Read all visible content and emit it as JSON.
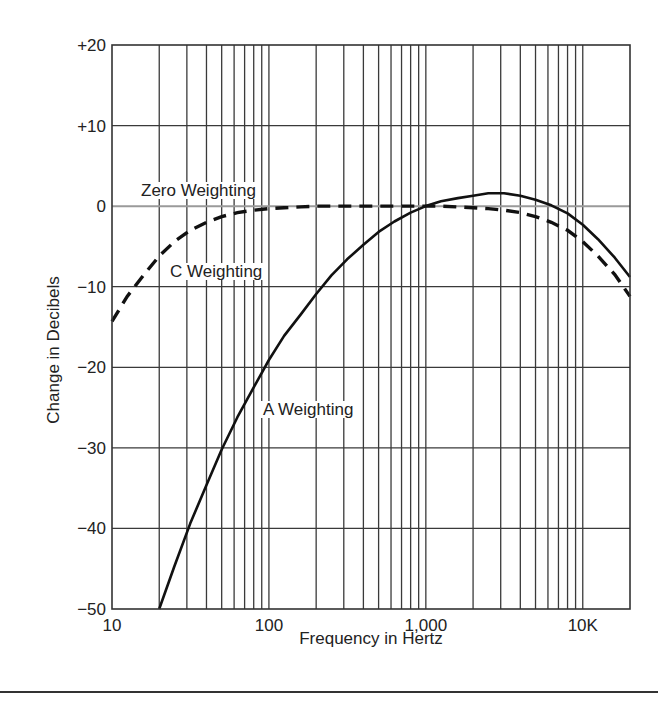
{
  "chart_data": {
    "type": "line",
    "title": "",
    "xlabel": "Frequency in Hertz",
    "ylabel": "Change in Decibels",
    "xscale": "log",
    "xlim": [
      10,
      20000
    ],
    "ylim": [
      -50,
      20
    ],
    "grid": true,
    "x_tick_labels": [
      {
        "value": 10,
        "label": "10"
      },
      {
        "value": 100,
        "label": "100"
      },
      {
        "value": 1000,
        "label": "1,000"
      },
      {
        "value": 10000,
        "label": "10K"
      }
    ],
    "y_tick_labels": [
      {
        "value": 20,
        "label": "+20"
      },
      {
        "value": 10,
        "label": "+10"
      },
      {
        "value": 0,
        "label": "0"
      },
      {
        "value": -10,
        "label": "−10"
      },
      {
        "value": -20,
        "label": "−20"
      },
      {
        "value": -30,
        "label": "−30"
      },
      {
        "value": -40,
        "label": "−40"
      },
      {
        "value": -50,
        "label": "−50"
      }
    ],
    "legend": "none (inline labels)",
    "series": [
      {
        "name": "Zero Weighting",
        "style": "solid-gray",
        "color": "#9a9a9a",
        "label_pos": {
          "x": 141,
          "y": 196
        },
        "x": [
          10,
          20000
        ],
        "values": [
          0,
          0
        ]
      },
      {
        "name": "C Weighting",
        "style": "dashed",
        "color": "#111111",
        "label_pos": {
          "x": 170,
          "y": 277
        },
        "x": [
          10,
          12.5,
          16,
          20,
          25,
          31.5,
          40,
          50,
          63,
          80,
          100,
          125,
          160,
          200,
          250,
          315,
          400,
          500,
          630,
          800,
          1000,
          1250,
          1600,
          2000,
          2500,
          3150,
          4000,
          5000,
          6300,
          8000,
          10000,
          12500,
          16000,
          20000
        ],
        "values": [
          -14.3,
          -11.2,
          -8.5,
          -6.2,
          -4.4,
          -3.0,
          -2.0,
          -1.3,
          -0.8,
          -0.5,
          -0.3,
          -0.2,
          -0.1,
          0,
          0,
          0,
          0,
          0,
          0,
          0,
          0,
          0,
          -0.1,
          -0.2,
          -0.3,
          -0.5,
          -0.8,
          -1.3,
          -2.0,
          -3.0,
          -4.4,
          -6.2,
          -8.5,
          -11.2
        ]
      },
      {
        "name": "A Weighting",
        "style": "solid",
        "color": "#111111",
        "label_pos": {
          "x": 263,
          "y": 415
        },
        "x": [
          20,
          25,
          31.5,
          40,
          50,
          63,
          80,
          100,
          125,
          160,
          200,
          250,
          315,
          400,
          500,
          630,
          800,
          1000,
          1250,
          1600,
          2000,
          2500,
          3150,
          4000,
          5000,
          6300,
          8000,
          10000,
          12500,
          16000,
          20000
        ],
        "values": [
          -50.5,
          -44.7,
          -39.4,
          -34.6,
          -30.2,
          -26.2,
          -22.5,
          -19.1,
          -16.1,
          -13.4,
          -10.9,
          -8.6,
          -6.6,
          -4.8,
          -3.2,
          -1.9,
          -0.8,
          0,
          0.6,
          1.0,
          1.3,
          1.6,
          1.6,
          1.3,
          0.8,
          0.1,
          -0.9,
          -2.3,
          -4.1,
          -6.4,
          -8.8
        ]
      }
    ],
    "annotations": [
      "Zero Weighting",
      "C Weighting",
      "A Weighting"
    ]
  },
  "layout": {
    "plot": {
      "left": 112,
      "top": 45,
      "right": 630,
      "bottom": 609
    },
    "colors": {
      "grid": "#3a3a3a",
      "frame": "#333333",
      "zero_line": "#9a9a9a",
      "curve": "#111111",
      "rule": "#333333"
    }
  }
}
